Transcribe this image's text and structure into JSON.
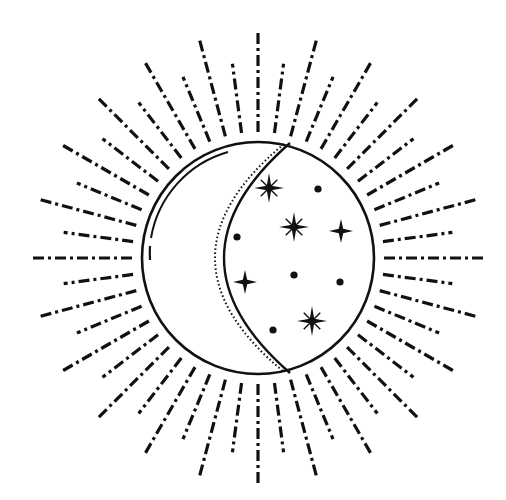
{
  "illustration": {
    "subject": "celestial sun with crescent moon and stars",
    "colors": {
      "ink": "#111111",
      "background": "#ffffff"
    },
    "center": [
      258,
      258
    ],
    "disc_radius": 116,
    "rays": {
      "count": 48,
      "long_radius": 228,
      "short_radius": 196,
      "inner_radius": 126
    },
    "stars": [
      {
        "type": "sparkle8",
        "x": 269,
        "y": 188,
        "size": 15
      },
      {
        "type": "sparkle8",
        "x": 294,
        "y": 227,
        "size": 15
      },
      {
        "type": "sparkle8",
        "x": 312,
        "y": 321,
        "size": 15
      },
      {
        "type": "cross4",
        "x": 341,
        "y": 231,
        "size": 12
      },
      {
        "type": "cross4",
        "x": 245,
        "y": 282,
        "size": 12
      }
    ],
    "dots": [
      {
        "x": 318,
        "y": 189
      },
      {
        "x": 237,
        "y": 237
      },
      {
        "x": 294,
        "y": 275
      },
      {
        "x": 340,
        "y": 282
      },
      {
        "x": 273,
        "y": 330
      }
    ]
  }
}
